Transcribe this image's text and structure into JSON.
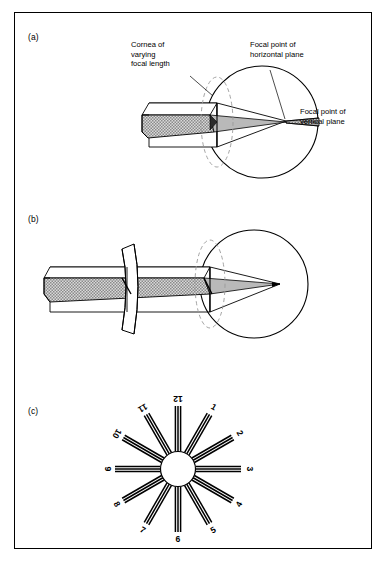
{
  "figure": {
    "title_visible": false,
    "border_color": "#000000",
    "background": "#ffffff"
  },
  "panels": [
    {
      "id": "a",
      "label": "(a)",
      "description": "Uncorrected astigmatic eye, two separate focal points",
      "callouts": [
        {
          "name": "cornea-callout",
          "text": "Cornea of\nvarying\nfocal length",
          "x": 131,
          "y": 40
        },
        {
          "name": "horizontal-focus-callout",
          "text": "Focal point of\nhorizontal plane",
          "x": 250,
          "y": 40
        },
        {
          "name": "vertical-focus-callout",
          "text": "Focal point of\nvertical plane",
          "x": 300,
          "y": 107
        }
      ]
    },
    {
      "id": "b",
      "label": "(b)",
      "description": "Astigmatism corrected by a cylindrical lens, single focal point",
      "callouts": []
    },
    {
      "id": "c",
      "label": "(c)",
      "description": "Astigmatic fan dial with twelve radial line groups",
      "callouts": []
    }
  ],
  "dial": {
    "name": "astigmatic-fan-dial",
    "spoke_count": 12,
    "lines_per_spoke": 3,
    "center_circle_fill": "#ffffff",
    "labels": [
      "1",
      "2",
      "3",
      "4",
      "5",
      "6",
      "7",
      "8",
      "9",
      "10",
      "11",
      "12"
    ]
  },
  "colors": {
    "ink": "#000000",
    "beam_fill": "#b3b3b3",
    "beam_fill_light": "#cccccc",
    "dashed_cornea": "#8c8c8c",
    "page": "#ffffff"
  }
}
